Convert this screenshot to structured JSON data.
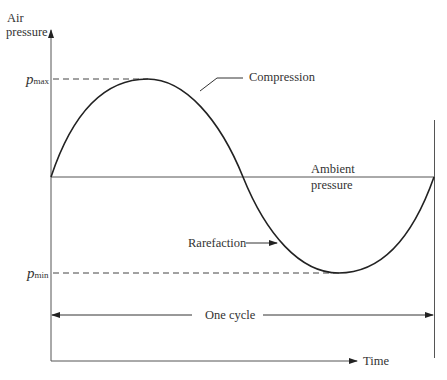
{
  "diagram": {
    "y_axis_label_line1": "Air",
    "y_axis_label_line2": "pressure",
    "x_axis_label": "Time",
    "pmax_symbol": "p",
    "pmax_sub": "max",
    "pmin_symbol": "p",
    "pmin_sub": "min",
    "compression_label": "Compression",
    "rarefaction_label": "Rarefaction",
    "ambient_line1": "Ambient",
    "ambient_line2": "pressure",
    "cycle_label": "One cycle"
  },
  "colors": {
    "line": "#2a2a2a",
    "axis": "#444444"
  }
}
